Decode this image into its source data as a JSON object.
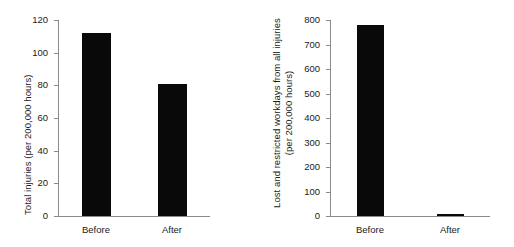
{
  "figure": {
    "background_color": "#ffffff",
    "bar_color": "#090909",
    "axis_color": "#8a8a8a"
  },
  "chart_data": [
    {
      "type": "bar",
      "title": "",
      "xlabel": "",
      "ylabel": "Total injuries (per 200,000 hours)",
      "categories": [
        "Before",
        "After"
      ],
      "values": [
        112,
        81
      ],
      "ylim": [
        0,
        120
      ],
      "yticks": [
        0,
        20,
        40,
        60,
        80,
        100,
        120
      ],
      "ytick_labels": [
        "0",
        "20",
        "40",
        "60",
        "80",
        "100",
        "120"
      ],
      "grid": false,
      "legend": null
    },
    {
      "type": "bar",
      "title": "",
      "xlabel": "",
      "ylabel_line1": "Lost and restricted workdays from all injuries",
      "ylabel_line2": "(per 200,000 hours)",
      "ylabel": "Lost and restricted workdays from all injuries (per 200,000 hours)",
      "categories": [
        "Before",
        "After"
      ],
      "values": [
        780,
        8
      ],
      "ylim": [
        0,
        800
      ],
      "yticks": [
        0,
        100,
        200,
        300,
        400,
        500,
        600,
        700,
        800
      ],
      "ytick_labels": [
        "0",
        "100",
        "200",
        "300",
        "400",
        "500",
        "600",
        "700",
        "800"
      ],
      "grid": false,
      "legend": null
    }
  ]
}
